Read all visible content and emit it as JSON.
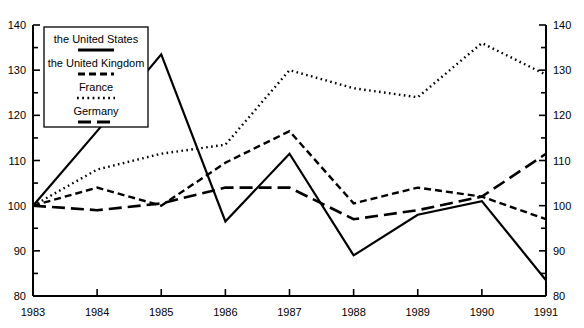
{
  "chart_data": {
    "type": "line",
    "title": "",
    "xlabel": "",
    "ylabel": "",
    "x": [
      1983,
      1984,
      1985,
      1986,
      1987,
      1988,
      1989,
      1990,
      1991
    ],
    "xticklabels": [
      "1983",
      "1984",
      "1985",
      "1986",
      "1987",
      "1988",
      "1989",
      "1990",
      "1991"
    ],
    "yticklabels": [
      "80",
      "90",
      "100",
      "110",
      "120",
      "130",
      "140"
    ],
    "yticks": [
      80,
      90,
      100,
      110,
      120,
      130,
      140
    ],
    "ylim": [
      80,
      140
    ],
    "xlim": [
      1983,
      1991
    ],
    "minor_ticks": true,
    "grid": false,
    "dual_axis": true,
    "legend_position": "upper-left-inset",
    "series": [
      {
        "name": "the United States",
        "style": "solid",
        "color": "#000000",
        "values": [
          100,
          116.5,
          133.5,
          96.5,
          111.5,
          89,
          98,
          101,
          83.5
        ]
      },
      {
        "name": "the United Kingdom",
        "style": "dashed",
        "color": "#000000",
        "values": [
          100,
          104,
          100,
          109.5,
          116.5,
          100.5,
          104,
          102,
          97
        ]
      },
      {
        "name": "France",
        "style": "dotted",
        "color": "#000000",
        "values": [
          100,
          108,
          111.5,
          113.5,
          130,
          126,
          124,
          136,
          129
        ]
      },
      {
        "name": "Germany",
        "style": "longdash",
        "color": "#000000",
        "values": [
          100,
          99,
          100.5,
          104,
          104,
          97,
          99,
          102,
          111.5
        ]
      }
    ]
  },
  "axes": {
    "left_labels": [
      "140",
      "130",
      "120",
      "110",
      "100",
      "90",
      "80"
    ],
    "right_labels": [
      "140",
      "130",
      "120",
      "110",
      "100",
      "90",
      "80"
    ],
    "bottom_labels": [
      "1983",
      "1984",
      "1985",
      "1986",
      "1987",
      "1988",
      "1989",
      "1990",
      "1991"
    ]
  },
  "legend": {
    "items": [
      {
        "label": "the United States",
        "style": "solid"
      },
      {
        "label": "the United Kingdom",
        "style": "dashed"
      },
      {
        "label": "France",
        "style": "dotted"
      },
      {
        "label": "Germany",
        "style": "longdash"
      }
    ]
  }
}
